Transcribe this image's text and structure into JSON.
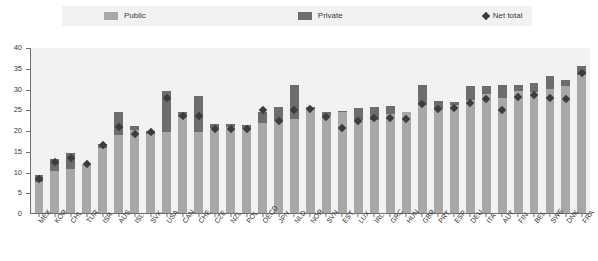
{
  "legend": {
    "items": [
      {
        "label": "Public",
        "icon": "square-swatch-icon",
        "color": "#a8a8a8",
        "type": "swatch"
      },
      {
        "label": "Private",
        "icon": "square-swatch-icon",
        "color": "#6d6d6d",
        "type": "swatch"
      },
      {
        "label": "Net total",
        "icon": "diamond-marker-icon",
        "color": "#3c3c3c",
        "type": "diamond"
      }
    ]
  },
  "colors": {
    "public": "#a8a8a8",
    "private": "#6d6d6d",
    "net_total_marker": "#3c3c3c",
    "plot_background": "#f2f2f2",
    "axis": "#6f6f6f",
    "legend_background": "#f2f2f2"
  },
  "chart_data": {
    "type": "bar",
    "title": "",
    "xlabel": "",
    "ylabel": "",
    "ylim": [
      0,
      40
    ],
    "yticks": [
      0,
      5,
      10,
      15,
      20,
      25,
      30,
      35,
      40
    ],
    "grid": false,
    "legend_position": "top",
    "stacked": true,
    "categories": [
      "MEX",
      "KOR",
      "CHL",
      "TUR",
      "ISR",
      "AUS",
      "ISL",
      "SVK",
      "USA",
      "CAN",
      "CHE",
      "CZE",
      "NZL",
      "POL",
      "OECD",
      "JPN",
      "NLD",
      "NOR",
      "SVN",
      "EST",
      "LUX",
      "IRL",
      "GRC",
      "HUN",
      "GBR",
      "PRT",
      "ESP",
      "DEU",
      "ITA",
      "AUT",
      "FIN",
      "BEL",
      "SWE",
      "DNK",
      "FRA"
    ],
    "series": [
      {
        "name": "Public",
        "color": "#a8a8a8",
        "values": [
          7.4,
          10.2,
          10.6,
          12.0,
          15.8,
          19.0,
          20.2,
          19.2,
          19.6,
          23.2,
          19.6,
          20.6,
          20.9,
          20.4,
          21.9,
          22.3,
          22.7,
          25.2,
          23.4,
          24.5,
          22.5,
          22.5,
          24.1,
          24.4,
          26.2,
          25.3,
          26.2,
          27.3,
          28.8,
          28.0,
          29.6,
          29.3,
          30.0,
          30.8,
          33.4
        ]
      },
      {
        "name": "Private",
        "color": "#6d6d6d",
        "values": [
          1.8,
          3.0,
          3.9,
          0.0,
          1.0,
          5.5,
          1.0,
          0.6,
          10.0,
          1.4,
          8.7,
          0.9,
          0.7,
          0.9,
          2.5,
          3.4,
          8.4,
          0.4,
          1.2,
          0.2,
          3.0,
          3.2,
          1.8,
          0.0,
          4.9,
          1.8,
          0.7,
          3.5,
          2.1,
          3.0,
          1.5,
          2.3,
          3.2,
          1.5,
          2.3
        ]
      }
    ],
    "net_total": {
      "name": "Net total",
      "marker": "diamond",
      "color": "#3c3c3c",
      "values": [
        8.2,
        12.3,
        13.4,
        12.0,
        16.5,
        20.9,
        19.2,
        19.6,
        27.9,
        23.6,
        23.4,
        20.4,
        20.4,
        20.3,
        25.0,
        22.4,
        24.9,
        25.2,
        23.3,
        20.6,
        22.4,
        23.1,
        23.0,
        22.8,
        26.4,
        25.1,
        25.5,
        26.7,
        27.6,
        25.0,
        28.2,
        28.5,
        28.0,
        27.6,
        33.9
      ]
    }
  }
}
